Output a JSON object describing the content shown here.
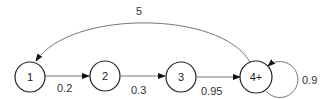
{
  "diagram": {
    "type": "state-transition",
    "nodes": [
      {
        "id": "n1",
        "label": "1"
      },
      {
        "id": "n2",
        "label": "2"
      },
      {
        "id": "n3",
        "label": "3"
      },
      {
        "id": "n4",
        "label": "4+"
      }
    ],
    "edges": [
      {
        "from": "1",
        "to": "2",
        "label": "0.2"
      },
      {
        "from": "2",
        "to": "3",
        "label": "0.3"
      },
      {
        "from": "3",
        "to": "4+",
        "label": "0.95"
      },
      {
        "from": "4+",
        "to": "4+",
        "label": "0.9"
      },
      {
        "from": "4+",
        "to": "1",
        "label": "5"
      }
    ]
  }
}
